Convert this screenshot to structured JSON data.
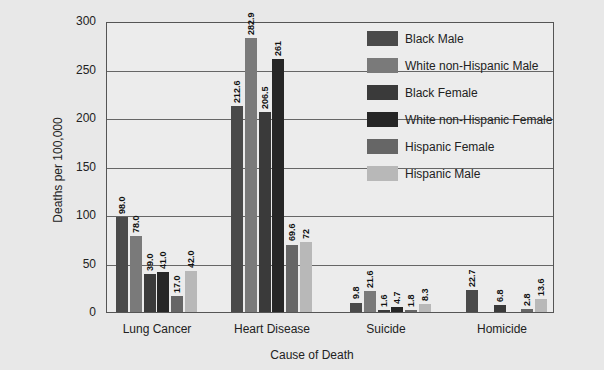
{
  "chart_data": {
    "type": "bar",
    "title": "",
    "xlabel": "Cause of Death",
    "ylabel": "Deaths per 100,000",
    "ylim": [
      0,
      300
    ],
    "yticks": [
      0,
      50,
      100,
      150,
      200,
      250,
      300
    ],
    "grid": true,
    "legend_position": "upper right inside",
    "categories": [
      "Lung Cancer",
      "Heart Disease",
      "Suicide",
      "Homicide"
    ],
    "series": [
      {
        "name": "Black Male",
        "color": "#4a4a4a",
        "values": [
          98.0,
          212.6,
          9.8,
          22.7
        ],
        "labels": [
          "98.0",
          "212.6",
          "9.8",
          "22.7"
        ]
      },
      {
        "name": "White non-Hispanic Male",
        "color": "#7a7a7a",
        "values": [
          78.0,
          282.9,
          21.6,
          null
        ],
        "labels": [
          "78.0",
          "282.9",
          "21.6",
          ""
        ]
      },
      {
        "name": "Black Female",
        "color": "#3a3a3a",
        "values": [
          39.0,
          206.5,
          1.6,
          6.8
        ],
        "labels": [
          "39.0",
          "206.5",
          "1.6",
          "6.8"
        ]
      },
      {
        "name": "White non-Hispanic Female",
        "color": "#262626",
        "values": [
          41.0,
          261,
          4.7,
          null
        ],
        "labels": [
          "41.0",
          "261",
          "4.7",
          ""
        ]
      },
      {
        "name": "Hispanic Female",
        "color": "#666666",
        "values": [
          17.0,
          69.6,
          1.8,
          2.8
        ],
        "labels": [
          "17.0",
          "69.6",
          "1.8",
          "2.8"
        ]
      },
      {
        "name": "Hispanic Male",
        "color": "#b8b8b8",
        "values": [
          42.0,
          72,
          8.3,
          13.6
        ],
        "labels": [
          "42.0",
          "72",
          "8.3",
          "13.6"
        ]
      }
    ]
  }
}
